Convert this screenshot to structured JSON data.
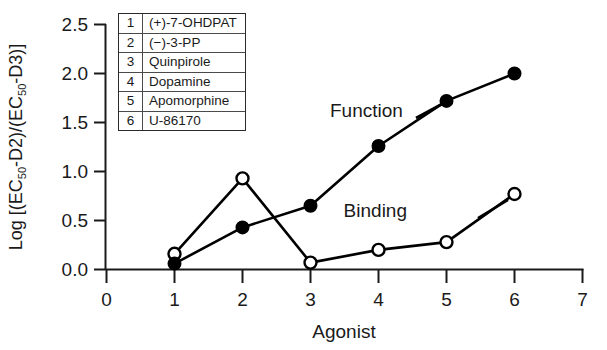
{
  "chart_data": {
    "type": "line",
    "title": "",
    "xlabel": "Agonist",
    "ylabel": "Log [(EC50-D2)/(EC50-D3)]",
    "ylabel_parts": {
      "lead": "Log [(EC",
      "sub1": "50",
      "mid": "-D2)/(EC",
      "sub2": "50",
      "tail": "-D3)]"
    },
    "x": [
      1,
      2,
      3,
      4,
      5,
      6
    ],
    "xlim": [
      0,
      7
    ],
    "ylim": [
      0.0,
      2.5
    ],
    "xticks": [
      "0",
      "1",
      "2",
      "3",
      "4",
      "5",
      "6",
      "7"
    ],
    "yticks": [
      "0.0",
      "0.5",
      "1.0",
      "1.5",
      "2.0",
      "2.5"
    ],
    "grid": false,
    "legend_position": "inline-annotation",
    "series": [
      {
        "name": "Function",
        "marker": "filled-circle",
        "color": "#000000",
        "values": [
          0.06,
          0.43,
          0.65,
          1.26,
          1.72,
          2.0
        ],
        "annotation": "Function"
      },
      {
        "name": "Binding",
        "marker": "open-circle",
        "color": "#000000",
        "values": [
          0.16,
          0.93,
          0.07,
          0.2,
          0.28,
          0.77
        ],
        "annotation": "Binding"
      }
    ],
    "annotations": [
      {
        "text": "Function",
        "x": 4.05,
        "y": 1.5
      },
      {
        "text": "Binding",
        "x": 5.2,
        "y": 0.63
      }
    ],
    "agonist_key": {
      "header_index": "",
      "header_name": "",
      "rows": [
        {
          "index": "1",
          "name": "(+)-7-OHDPAT"
        },
        {
          "index": "2",
          "name": "(−)-3-PP"
        },
        {
          "index": "3",
          "name": "Quinpirole"
        },
        {
          "index": "4",
          "name": "Dopamine"
        },
        {
          "index": "5",
          "name": "Apomorphine"
        },
        {
          "index": "6",
          "name": "U-86170"
        }
      ]
    }
  },
  "axis": {
    "x_title": "Agonist",
    "x_tick_0": "0",
    "x_tick_1": "1",
    "x_tick_2": "2",
    "x_tick_3": "3",
    "x_tick_4": "4",
    "x_tick_5": "5",
    "x_tick_6": "6",
    "x_tick_7": "7",
    "y_tick_0": "0.0",
    "y_tick_1": "0.5",
    "y_tick_2": "1.0",
    "y_tick_3": "1.5",
    "y_tick_4": "2.0",
    "y_tick_5": "2.5"
  },
  "labels": {
    "function_annot": "Function",
    "binding_annot": "Binding"
  },
  "colors": {
    "axis": "#1a1a1a",
    "series": "#000000",
    "legend_border": "#2a2a2a",
    "background": "#ffffff"
  }
}
